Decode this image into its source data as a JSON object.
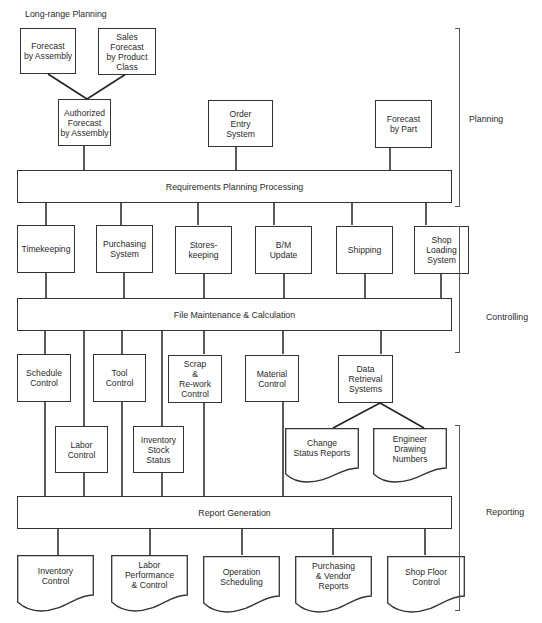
{
  "diagram": {
    "top_label": "Long-range Planning",
    "planning": {
      "forecast_by_assembly": "Forecast\nby Assembly",
      "sales_forecast": "Sales\nForecast\nby Product\nClass",
      "authorized_forecast": "Authorized\nForecast\nby Assembly",
      "order_entry": "Order\nEntry\nSystem",
      "forecast_by_part": "Forecast\nby Part",
      "requirements_bar": "Requirements Planning Processing"
    },
    "controlling": {
      "inputs": [
        "Timekeeping",
        "Purchasing\nSystem",
        "Stores-\nkeeping",
        "B/M\nUpdate",
        "Shipping",
        "Shop\nLoading\nSystem"
      ],
      "file_bar": "File Maintenance & Calculation",
      "outputs": [
        "Schedule\nControl",
        "Tool\nControl",
        "Scrap\n&\nRe-work\nControl",
        "Material\nControl",
        "Data\nRetrieval\nSystems"
      ],
      "lower_outputs": [
        "Labor\nControl",
        "Inventory\nStock\nStatus"
      ]
    },
    "retrieval_docs": [
      "Change\nStatus Reports",
      "Engineer\nDrawing\nNumbers"
    ],
    "reporting": {
      "report_bar": "Report Generation",
      "documents": [
        "Inventory\nControl",
        "Labor\nPerformance\n& Control",
        "Operation\nScheduling",
        "Purchasing\n& Vendor\nReports",
        "Shop Floor\nControl"
      ]
    },
    "phases": {
      "planning": "Planning",
      "controlling": "Controlling",
      "reporting": "Reporting"
    }
  }
}
